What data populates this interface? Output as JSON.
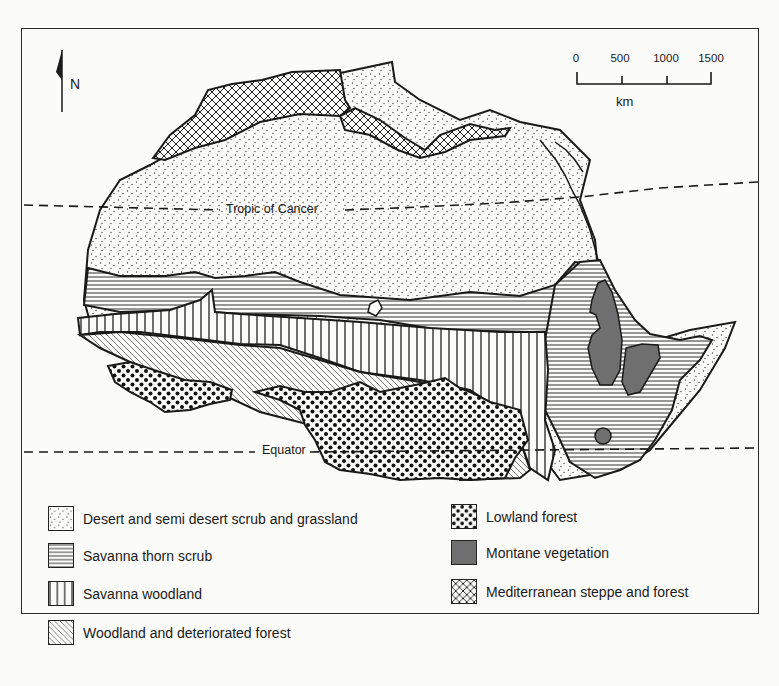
{
  "map": {
    "subject": "Vegetation zones of Africa (northern half)",
    "north_arrow": {
      "icon": "north-arrow-icon",
      "label": "N"
    },
    "scale_bar": {
      "ticks": [
        "0",
        "500",
        "1000",
        "1500"
      ],
      "unit": "km"
    },
    "reference_lines": {
      "tropic_of_cancer": "Tropic of Cancer",
      "equator": "Equator"
    },
    "colors": {
      "ink": "#1a1a1a",
      "background": "#fbfbf9",
      "montane_fill": "#6f6f6f"
    }
  },
  "legend": {
    "items": [
      {
        "id": "desert",
        "pattern": "fine-stipple",
        "label": "Desert and semi desert scrub and grassland"
      },
      {
        "id": "thorn",
        "pattern": "horizontal-lines",
        "label": "Savanna thorn scrub"
      },
      {
        "id": "savanna-woodland",
        "pattern": "vertical-lines",
        "label": "Savanna woodland"
      },
      {
        "id": "deteriorated",
        "pattern": "diagonal-lines",
        "label": "Woodland and deteriorated forest"
      },
      {
        "id": "lowland",
        "pattern": "coarse-dots",
        "label": "Lowland forest"
      },
      {
        "id": "montane",
        "pattern": "solid-grey",
        "label": "Montane vegetation"
      },
      {
        "id": "mediterranean",
        "pattern": "crosshatch",
        "label": "Mediterranean steppe and forest"
      }
    ]
  }
}
